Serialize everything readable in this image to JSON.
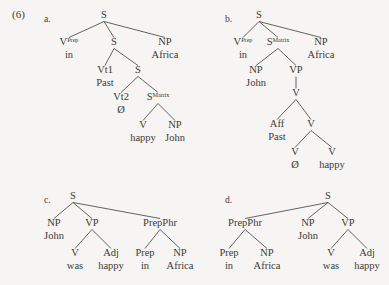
{
  "figure": {
    "example_number": "(6)",
    "background_color": "#f6f5f3",
    "ink_color": "#3b3a38",
    "panel_letters": [
      "a.",
      "b.",
      "c.",
      "d."
    ]
  },
  "trees": [
    {
      "id": "tree-a",
      "letter": "a.",
      "letter_pos": [
        44,
        22
      ],
      "nodes": [
        {
          "name": "a-root-s",
          "label": "S",
          "sup": "",
          "word": "",
          "x": 104,
          "y": 18
        },
        {
          "name": "a-v-prep",
          "label": "V",
          "sup": "Prep",
          "word": "in",
          "x": 69,
          "y": 45
        },
        {
          "name": "a-s-embedded-1",
          "label": "S",
          "sup": "",
          "word": "",
          "x": 114,
          "y": 45
        },
        {
          "name": "a-np-africa",
          "label": "NP",
          "sup": "",
          "word": "Africa",
          "x": 165,
          "y": 45
        },
        {
          "name": "a-vt1",
          "label": "Vt1",
          "sup": "",
          "word": "Past",
          "x": 105,
          "y": 73
        },
        {
          "name": "a-s-embedded-2",
          "label": "S",
          "sup": "",
          "word": "",
          "x": 138,
          "y": 73
        },
        {
          "name": "a-vt2",
          "label": "Vt2",
          "sup": "",
          "word": "Ø",
          "x": 121,
          "y": 100
        },
        {
          "name": "a-s-matrix",
          "label": "S",
          "sup": "Matrix",
          "word": "",
          "x": 158,
          "y": 100
        },
        {
          "name": "a-v-happy",
          "label": "V",
          "sup": "",
          "word": "happy",
          "x": 143,
          "y": 128
        },
        {
          "name": "a-np-john",
          "label": "NP",
          "sup": "",
          "word": "John",
          "x": 175,
          "y": 128
        }
      ],
      "edges": [
        [
          "a-root-s",
          "a-v-prep"
        ],
        [
          "a-root-s",
          "a-s-embedded-1"
        ],
        [
          "a-root-s",
          "a-np-africa"
        ],
        [
          "a-s-embedded-1",
          "a-vt1"
        ],
        [
          "a-s-embedded-1",
          "a-s-embedded-2"
        ],
        [
          "a-s-embedded-2",
          "a-vt2"
        ],
        [
          "a-s-embedded-2",
          "a-s-matrix"
        ],
        [
          "a-s-matrix",
          "a-v-happy"
        ],
        [
          "a-s-matrix",
          "a-np-john"
        ]
      ]
    },
    {
      "id": "tree-b",
      "letter": "b.",
      "letter_pos": [
        225,
        22
      ],
      "nodes": [
        {
          "name": "b-root-s",
          "label": "S",
          "sup": "",
          "word": "",
          "x": 259,
          "y": 18
        },
        {
          "name": "b-v-prep",
          "label": "V",
          "sup": "Prep",
          "word": "in",
          "x": 243,
          "y": 45
        },
        {
          "name": "b-s-matrix",
          "label": "S",
          "sup": "Matrix",
          "word": "",
          "x": 278,
          "y": 45
        },
        {
          "name": "b-np-africa",
          "label": "NP",
          "sup": "",
          "word": "Africa",
          "x": 321,
          "y": 45
        },
        {
          "name": "b-np-john",
          "label": "NP",
          "sup": "",
          "word": "John",
          "x": 256,
          "y": 73
        },
        {
          "name": "b-vp",
          "label": "VP",
          "sup": "",
          "word": "",
          "x": 296,
          "y": 73
        },
        {
          "name": "b-v-mid",
          "label": "V",
          "sup": "",
          "word": "",
          "x": 296,
          "y": 96
        },
        {
          "name": "b-aff",
          "label": "Aff",
          "sup": "",
          "word": "Past",
          "x": 277,
          "y": 127
        },
        {
          "name": "b-v-lower",
          "label": "V",
          "sup": "",
          "word": "",
          "x": 311,
          "y": 127
        },
        {
          "name": "b-v-null",
          "label": "V",
          "sup": "",
          "word": "Ø",
          "x": 295,
          "y": 155
        },
        {
          "name": "b-v-happy",
          "label": "V",
          "sup": "",
          "word": "happy",
          "x": 332,
          "y": 155
        }
      ],
      "edges": [
        [
          "b-root-s",
          "b-v-prep"
        ],
        [
          "b-root-s",
          "b-s-matrix"
        ],
        [
          "b-root-s",
          "b-np-africa"
        ],
        [
          "b-s-matrix",
          "b-np-john"
        ],
        [
          "b-s-matrix",
          "b-vp"
        ],
        [
          "b-vp",
          "b-v-mid"
        ],
        [
          "b-v-mid",
          "b-aff"
        ],
        [
          "b-v-mid",
          "b-v-lower"
        ],
        [
          "b-v-lower",
          "b-v-null"
        ],
        [
          "b-v-lower",
          "b-v-happy"
        ]
      ]
    },
    {
      "id": "tree-c",
      "letter": "c.",
      "letter_pos": [
        44,
        203
      ],
      "nodes": [
        {
          "name": "c-root-s",
          "label": "S",
          "sup": "",
          "word": "",
          "x": 73,
          "y": 199
        },
        {
          "name": "c-np-john",
          "label": "NP",
          "sup": "",
          "word": "John",
          "x": 54,
          "y": 226
        },
        {
          "name": "c-vp",
          "label": "VP",
          "sup": "",
          "word": "",
          "x": 92,
          "y": 226
        },
        {
          "name": "c-prepphr",
          "label": "PrepPhr",
          "sup": "",
          "word": "",
          "x": 160,
          "y": 226
        },
        {
          "name": "c-v-was",
          "label": "V",
          "sup": "",
          "word": "was",
          "x": 75,
          "y": 256
        },
        {
          "name": "c-adj-happy",
          "label": "Adj",
          "sup": "",
          "word": "happy",
          "x": 111,
          "y": 256
        },
        {
          "name": "c-prep-in",
          "label": "Prep",
          "sup": "",
          "word": "in",
          "x": 145,
          "y": 256
        },
        {
          "name": "c-np-africa",
          "label": "NP",
          "sup": "",
          "word": "Africa",
          "x": 180,
          "y": 256
        }
      ],
      "edges": [
        [
          "c-root-s",
          "c-np-john"
        ],
        [
          "c-root-s",
          "c-vp"
        ],
        [
          "c-root-s",
          "c-prepphr"
        ],
        [
          "c-vp",
          "c-v-was"
        ],
        [
          "c-vp",
          "c-adj-happy"
        ],
        [
          "c-prepphr",
          "c-prep-in"
        ],
        [
          "c-prepphr",
          "c-np-africa"
        ]
      ]
    },
    {
      "id": "tree-d",
      "letter": "d.",
      "letter_pos": [
        225,
        203
      ],
      "nodes": [
        {
          "name": "d-root-s",
          "label": "S",
          "sup": "",
          "word": "",
          "x": 328,
          "y": 199
        },
        {
          "name": "d-prepphr",
          "label": "PrepPhr",
          "sup": "",
          "word": "",
          "x": 245,
          "y": 226
        },
        {
          "name": "d-np-john",
          "label": "NP",
          "sup": "",
          "word": "John",
          "x": 308,
          "y": 226
        },
        {
          "name": "d-vp",
          "label": "VP",
          "sup": "",
          "word": "",
          "x": 348,
          "y": 226
        },
        {
          "name": "d-prep-in",
          "label": "Prep",
          "sup": "",
          "word": "in",
          "x": 229,
          "y": 256
        },
        {
          "name": "d-np-africa",
          "label": "NP",
          "sup": "",
          "word": "Africa",
          "x": 267,
          "y": 256
        },
        {
          "name": "d-v-was",
          "label": "V",
          "sup": "",
          "word": "was",
          "x": 331,
          "y": 256
        },
        {
          "name": "d-adj-happy",
          "label": "Adj",
          "sup": "",
          "word": "happy",
          "x": 367,
          "y": 256
        }
      ],
      "edges": [
        [
          "d-root-s",
          "d-prepphr"
        ],
        [
          "d-root-s",
          "d-np-john"
        ],
        [
          "d-root-s",
          "d-vp"
        ],
        [
          "d-prepphr",
          "d-prep-in"
        ],
        [
          "d-prepphr",
          "d-np-africa"
        ],
        [
          "d-vp",
          "d-v-was"
        ],
        [
          "d-vp",
          "d-adj-happy"
        ]
      ]
    }
  ]
}
